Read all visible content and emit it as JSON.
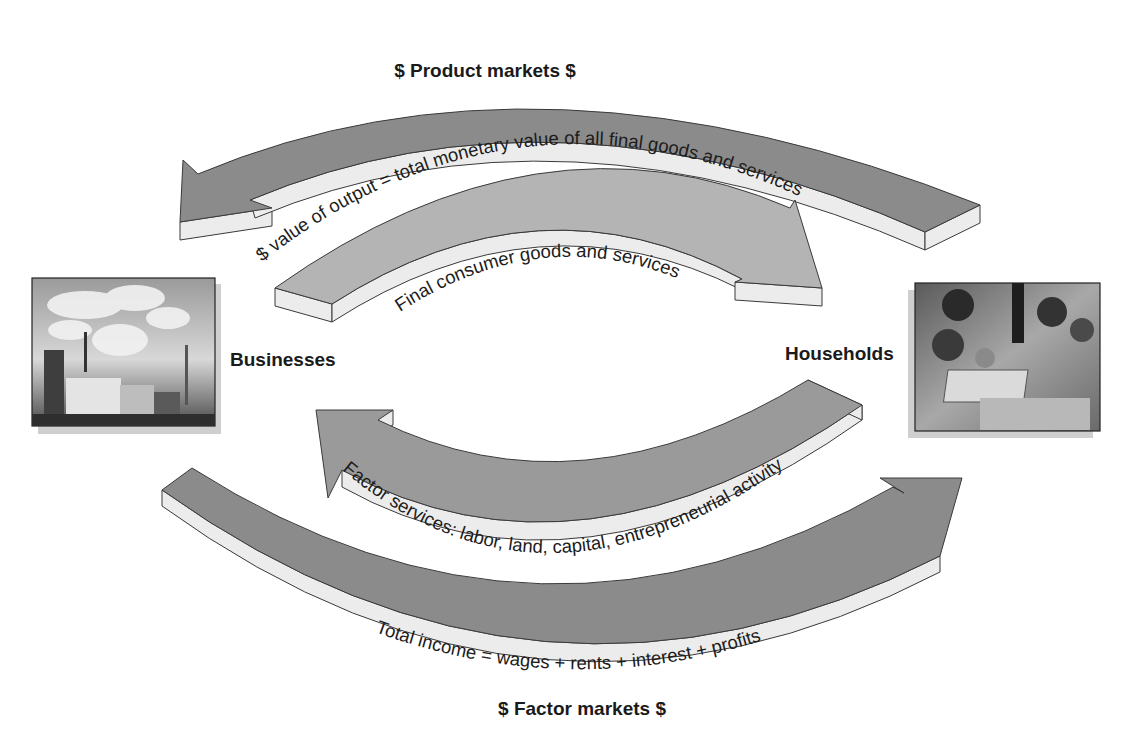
{
  "diagram": {
    "type": "circular-flow",
    "top_title": "$ Product markets $",
    "bottom_title": "$ Factor markets $",
    "nodes": {
      "left": {
        "label": "Businesses",
        "image": "factory-photo"
      },
      "right": {
        "label": "Households",
        "image": "family-photo"
      }
    },
    "flows": [
      {
        "id": "output-value",
        "text": "$ value of output = total monetary value of all final goods and services",
        "direction": "households-to-businesses",
        "shade": "dark"
      },
      {
        "id": "consumer-goods",
        "text": "Final consumer goods and services",
        "direction": "businesses-to-households",
        "shade": "light"
      },
      {
        "id": "factor-services",
        "text": "Factor services: labor, land, capital, entrepreneurial activity",
        "direction": "households-to-businesses",
        "shade": "medium"
      },
      {
        "id": "total-income",
        "text": "Total income = wages + rents + interest + profits",
        "direction": "businesses-to-households",
        "shade": "dark"
      }
    ],
    "colors": {
      "dark_face": "#8b8b8b",
      "light_face": "#b4b4b4",
      "side": "#ececec",
      "text": "#1a1a1a"
    }
  }
}
